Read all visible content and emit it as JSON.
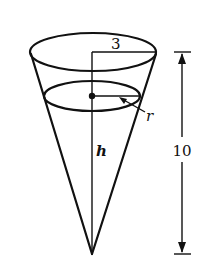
{
  "diagram": {
    "type": "inverted-cone-tank",
    "labels": {
      "top_radius": "3",
      "water_radius": "r",
      "water_height": "h",
      "total_height": "10"
    },
    "colors": {
      "stroke": "#111111",
      "background": "#ffffff"
    }
  }
}
